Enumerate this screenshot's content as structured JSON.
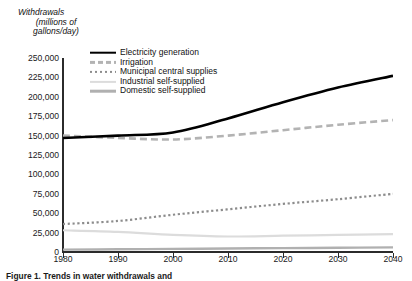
{
  "figure": {
    "y_axis_title_lines": [
      "Withdrawals",
      "(millions of",
      "gallons/day)"
    ],
    "caption": "Figure 1. Trends in water withdrawals and"
  },
  "legend": {
    "items": [
      {
        "label": "Electricity generation",
        "style": "solid-black",
        "color": "#000000"
      },
      {
        "label": "Irrigation",
        "style": "dash-gray",
        "color": "#b3b3b3"
      },
      {
        "label": "Municipal central supplies",
        "style": "dot-gray",
        "color": "#8c8c8c"
      },
      {
        "label": "Industrial self-supplied",
        "style": "solid-pale",
        "color": "#dcdcdc"
      },
      {
        "label": "Domestic self-supplied",
        "style": "solid-mid",
        "color": "#b0b0b0"
      }
    ]
  },
  "chart_data": {
    "type": "line",
    "title": "",
    "xlabel": "",
    "ylabel": "Withdrawals (millions of gallons/day)",
    "x": [
      1980,
      1990,
      2000,
      2010,
      2020,
      2030,
      2040
    ],
    "xlim": [
      1980,
      2040
    ],
    "ylim": [
      0,
      250000
    ],
    "ytick_labels": [
      "0",
      "25,000",
      "50,000",
      "75,000",
      "100,000",
      "125,000",
      "150,000",
      "175,000",
      "200,000",
      "225,000",
      "250,000"
    ],
    "yticks": [
      0,
      25000,
      50000,
      75000,
      100000,
      125000,
      150000,
      175000,
      200000,
      225000,
      250000
    ],
    "xtick_labels": [
      "1980",
      "1990",
      "2000",
      "2010",
      "2020",
      "2030",
      "2040"
    ],
    "grid": false,
    "legend_position": "upper-center-left-inside",
    "series": [
      {
        "name": "Electricity generation",
        "values": [
          147000,
          150000,
          154000,
          172000,
          193000,
          212000,
          227000
        ]
      },
      {
        "name": "Irrigation",
        "values": [
          150000,
          147000,
          145000,
          150000,
          157000,
          164000,
          170000
        ]
      },
      {
        "name": "Municipal central supplies",
        "values": [
          36000,
          40000,
          48000,
          55000,
          62000,
          68000,
          75000
        ]
      },
      {
        "name": "Industrial self-supplied",
        "values": [
          28000,
          26000,
          22000,
          20000,
          21000,
          22000,
          23000
        ]
      },
      {
        "name": "Domestic self-supplied",
        "values": [
          3000,
          3500,
          4000,
          4500,
          5000,
          5500,
          6000
        ]
      }
    ]
  }
}
